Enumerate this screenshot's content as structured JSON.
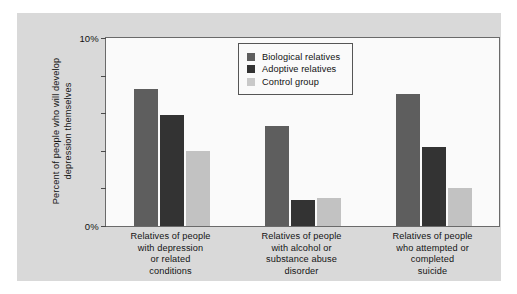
{
  "chart_data": {
    "type": "bar",
    "title": "",
    "subtitle": "",
    "xlabel": "",
    "ylabel": "Percent of people who will develop depression themselves",
    "ylim": [
      0,
      10
    ],
    "y_unit": "%",
    "grid": false,
    "legend_position": "top-center-inside",
    "y_ticks": [
      {
        "value": 10,
        "label": "10%"
      },
      {
        "value": 8,
        "label": ""
      },
      {
        "value": 6,
        "label": ""
      },
      {
        "value": 4,
        "label": ""
      },
      {
        "value": 2,
        "label": ""
      },
      {
        "value": 0,
        "label": "0%"
      }
    ],
    "categories": [
      "Relatives of people with depression or related conditions",
      "Relatives of people with alcohol or substance abuse disorder",
      "Relatives of people who attempted or completed suicide"
    ],
    "category_lines": [
      [
        "Relatives of people",
        "with depression",
        "or related",
        "conditions"
      ],
      [
        "Relatives of people",
        "with alcohol or",
        "substance abuse",
        "disorder"
      ],
      [
        "Relatives of people",
        "who attempted or",
        "completed",
        "suicide"
      ]
    ],
    "series": [
      {
        "name": "Biological relatives",
        "color": "#5e5e5e",
        "values": [
          7.3,
          5.3,
          7.0
        ]
      },
      {
        "name": "Adoptive relatives",
        "color": "#333333",
        "values": [
          5.9,
          1.4,
          4.2
        ]
      },
      {
        "name": "Control group",
        "color": "#c9c9c9",
        "values": [
          4.0,
          1.5,
          2.0
        ]
      }
    ]
  },
  "legend": {
    "items": [
      {
        "label": "Biological relatives",
        "swatch": "biological"
      },
      {
        "label": "Adoptive relatives",
        "swatch": "adoptive"
      },
      {
        "label": "Control group",
        "swatch": "control"
      }
    ]
  },
  "colors": {
    "biological": "#5e5e5e",
    "adoptive": "#333333",
    "control": "#c9c9c9",
    "panel_background": "#d9d9d9",
    "plot_background": "#fafafa",
    "axis": "#6a6a6a"
  }
}
